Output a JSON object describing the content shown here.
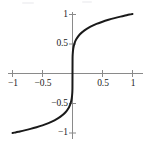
{
  "figure": {
    "background_color": "#ffffff",
    "axis_color": "#8a8a8a",
    "curve_color": "#1a1a1a",
    "label_color": "#1b1b1b"
  },
  "chart_data": {
    "type": "line",
    "title": "",
    "subtitle": "",
    "xlabel": "",
    "ylabel": "",
    "xlim": [
      -1.08,
      1.08
    ],
    "ylim": [
      -1.1,
      1.1
    ],
    "grid": false,
    "legend": "none",
    "axes_cross_at_origin": true,
    "xticks": [
      -1,
      -0.5,
      0.5,
      1
    ],
    "xtick_labels": [
      "−1",
      "−0.5",
      "0.5",
      "1"
    ],
    "yticks": [
      -1,
      -0.5,
      0.5,
      1
    ],
    "ytick_labels": [
      "−1",
      "−0.5",
      "0.5",
      "1"
    ],
    "series": [
      {
        "name": "y = x^(1/5)",
        "description": "odd S-shaped root curve, steep at origin, flattening toward the ends",
        "x": [
          -1.0,
          -0.95,
          -0.9,
          -0.8,
          -0.7,
          -0.6,
          -0.5,
          -0.4,
          -0.3,
          -0.2,
          -0.12,
          -0.06,
          -0.03,
          -0.012,
          -0.004,
          -0.001,
          0.0,
          0.001,
          0.004,
          0.012,
          0.03,
          0.06,
          0.12,
          0.2,
          0.3,
          0.4,
          0.5,
          0.6,
          0.7,
          0.8,
          0.9,
          0.95,
          1.0
        ],
        "y": [
          -1.0,
          -0.99,
          -0.979,
          -0.956,
          -0.931,
          -0.903,
          -0.871,
          -0.833,
          -0.786,
          -0.725,
          -0.655,
          -0.57,
          -0.496,
          -0.414,
          -0.332,
          -0.251,
          0.0,
          0.251,
          0.332,
          0.414,
          0.496,
          0.57,
          0.655,
          0.725,
          0.786,
          0.833,
          0.871,
          0.903,
          0.931,
          0.956,
          0.979,
          0.99,
          1.0
        ]
      }
    ]
  },
  "labels": {
    "x_neg1": "−1",
    "x_neg_half": "−0.5",
    "x_pos_half": "0.5",
    "x_pos1": "1",
    "y_pos1": "1",
    "y_pos_half": "0.5",
    "y_neg_half": "−0.5",
    "y_neg1": "−1"
  }
}
